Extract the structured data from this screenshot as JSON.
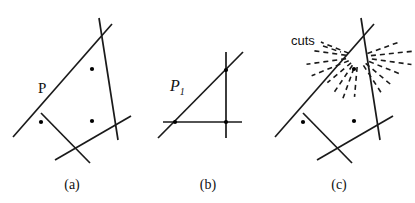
{
  "figure": {
    "width": 415,
    "height": 203,
    "background": "#ffffff",
    "stroke_color": "#1a1a1a",
    "dot_color": "#000000",
    "panels": [
      {
        "id": "panel-a",
        "caption": "(a)",
        "caption_pos": [
          72,
          185
        ],
        "label": "P",
        "label_pos": [
          42,
          90
        ],
        "description": "Convex quadrilateral formed by four intersecting solid lines, with three interior dots",
        "lines": [
          {
            "name": "edge-upper-left",
            "x1": 13,
            "y1": 137,
            "x2": 112,
            "y2": 24
          },
          {
            "name": "edge-right",
            "x1": 99,
            "y1": 18,
            "x2": 118,
            "y2": 140
          },
          {
            "name": "edge-lower-right",
            "x1": 55,
            "y1": 160,
            "x2": 131,
            "y2": 116
          },
          {
            "name": "edge-lower-left",
            "x1": 41,
            "y1": 113,
            "x2": 90,
            "y2": 163
          }
        ],
        "vertices": [
          {
            "name": "vertex-top",
            "x": 103,
            "y": 41
          },
          {
            "name": "vertex-right",
            "x": 114,
            "y": 121
          },
          {
            "name": "vertex-bottom",
            "x": 72,
            "y": 146
          },
          {
            "name": "vertex-left",
            "x": 27,
            "y": 122
          }
        ],
        "dots": [
          {
            "name": "interior-point-1",
            "x": 92,
            "y": 69
          },
          {
            "name": "interior-point-2",
            "x": 41,
            "y": 122
          },
          {
            "name": "interior-point-3",
            "x": 92,
            "y": 121
          }
        ]
      },
      {
        "id": "panel-b",
        "caption": "(b)",
        "caption_pos": [
          208,
          185
        ],
        "label": "P",
        "label_sub": "1",
        "label_pos": [
          178,
          88
        ],
        "description": "Right triangle formed by one horizontal line, one vertical line and one diagonal line, with three vertex dots",
        "lines": [
          {
            "name": "line-horizontal",
            "x1": 163,
            "y1": 122,
            "x2": 242,
            "y2": 122
          },
          {
            "name": "line-vertical",
            "x1": 226,
            "y1": 52,
            "x2": 226,
            "y2": 138
          },
          {
            "name": "line-diagonal",
            "x1": 158,
            "y1": 138,
            "x2": 243,
            "y2": 52
          }
        ],
        "dots": [
          {
            "name": "vertex-point-1",
            "x": 226,
            "y": 70
          },
          {
            "name": "vertex-point-2",
            "x": 175,
            "y": 122
          },
          {
            "name": "vertex-point-3",
            "x": 226,
            "y": 122
          }
        ]
      },
      {
        "id": "panel-c",
        "caption": "(c)",
        "caption_pos": [
          339,
          185
        ],
        "label": "cuts",
        "label_pos": [
          293,
          44
        ],
        "description": "Same convex quadrilateral as panel (a) with a fan of dashed candidate cut lines radiating from the top vertex",
        "lines": [
          {
            "name": "edge-upper-left",
            "x1": 275,
            "y1": 137,
            "x2": 374,
            "y2": 24
          },
          {
            "name": "edge-right",
            "x1": 361,
            "y1": 18,
            "x2": 380,
            "y2": 140
          },
          {
            "name": "edge-lower-right",
            "x1": 317,
            "y1": 160,
            "x2": 393,
            "y2": 116
          },
          {
            "name": "edge-lower-left",
            "x1": 303,
            "y1": 113,
            "x2": 352,
            "y2": 163
          }
        ],
        "vertices": [
          {
            "name": "vertex-top",
            "x": 365,
            "y": 41
          },
          {
            "name": "vertex-right",
            "x": 376,
            "y": 121
          },
          {
            "name": "vertex-bottom",
            "x": 334,
            "y": 146
          },
          {
            "name": "vertex-left",
            "x": 289,
            "y": 122
          }
        ],
        "dots": [
          {
            "name": "interior-point-1",
            "x": 354,
            "y": 69
          },
          {
            "name": "interior-point-2",
            "x": 303,
            "y": 122
          },
          {
            "name": "interior-point-3",
            "x": 354,
            "y": 121
          }
        ],
        "cut_fan": {
          "name": "dashed-cut-fan",
          "center": [
            358,
            57
          ],
          "count": 14,
          "dash_pattern": "5,4",
          "rays": [
            {
              "angle_deg": 265,
              "r_inner": 10,
              "r_outer": 40
            },
            {
              "angle_deg": 250,
              "r_inner": 12,
              "r_outer": 44
            },
            {
              "angle_deg": 236,
              "r_inner": 10,
              "r_outer": 42
            },
            {
              "angle_deg": 220,
              "r_inner": 9,
              "r_outer": 40
            },
            {
              "angle_deg": 202,
              "r_inner": 10,
              "r_outer": 50
            },
            {
              "angle_deg": 188,
              "r_inner": 12,
              "r_outer": 52
            },
            {
              "angle_deg": 172,
              "r_inner": 12,
              "r_outer": 48
            },
            {
              "angle_deg": 158,
              "r_inner": 10,
              "r_outer": 40
            },
            {
              "angle_deg": 20,
              "r_inner": 10,
              "r_outer": 44
            },
            {
              "angle_deg": 6,
              "r_inner": 13,
              "r_outer": 56
            },
            {
              "angle_deg": 352,
              "r_inner": 14,
              "r_outer": 54
            },
            {
              "angle_deg": 338,
              "r_inner": 12,
              "r_outer": 48
            },
            {
              "angle_deg": 320,
              "r_inner": 10,
              "r_outer": 44
            },
            {
              "angle_deg": 303,
              "r_inner": 10,
              "r_outer": 46
            }
          ]
        }
      }
    ]
  }
}
